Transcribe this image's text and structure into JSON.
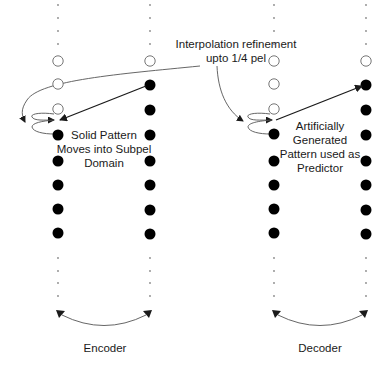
{
  "diagram": {
    "annotation": {
      "lines": [
        "Interpolation refinement",
        "upto 1/4 pel"
      ],
      "x": 236,
      "y": 48
    },
    "panels": [
      {
        "id": "encoder",
        "label": "Encoder",
        "label_pos": [
          105,
          352
        ],
        "caption": {
          "lines": [
            "Solid Pattern",
            "Moves into Subpel",
            "Domain"
          ],
          "x": 104,
          "y": 139
        },
        "columns": [
          {
            "x": 58,
            "small_dots_top": [
              5,
              18,
              31,
              44
            ],
            "hollow": [
              61,
              84,
              109
            ],
            "filled": [
              135,
              161,
              185,
              209,
              233
            ],
            "small_dots_bottom": [
              258,
              271,
              283,
              296
            ]
          },
          {
            "x": 150,
            "small_dots_top": [
              5,
              18,
              31,
              44
            ],
            "hollow": [
              61
            ],
            "filled": [
              85,
              110,
              135,
              161,
              185,
              210,
              234
            ],
            "small_dots_bottom": [
              258,
              271,
              283,
              296
            ]
          }
        ],
        "main_arrow": {
          "from": [
            146,
            86
          ],
          "to": [
            60,
            120
          ]
        }
      },
      {
        "id": "decoder",
        "label": "Decoder",
        "label_pos": [
          320,
          352
        ],
        "caption": {
          "lines": [
            "Artificially",
            "Generated",
            "Pattern used as",
            "Predictor"
          ],
          "x": 320,
          "y": 130
        },
        "columns": [
          {
            "x": 274,
            "small_dots_top": [
              5,
              18,
              31,
              44
            ],
            "hollow": [
              61,
              84,
              109
            ],
            "filled": [
              134,
              161,
              185,
              209,
              233
            ],
            "small_dots_bottom": [
              258,
              271,
              283,
              296
            ]
          },
          {
            "x": 366,
            "small_dots_top": [
              5,
              18,
              31,
              44
            ],
            "hollow": [
              61
            ],
            "filled": [
              85,
              110,
              135,
              161,
              185,
              210,
              234
            ],
            "small_dots_bottom": [
              258,
              271,
              283,
              296
            ]
          }
        ],
        "main_arrow": {
          "from": [
            276,
            120
          ],
          "to": [
            362,
            86
          ]
        }
      }
    ],
    "colors": {
      "stroke": "#1a1a1a",
      "curve": "#555555",
      "dot": "#000000",
      "small_dot": "#888888",
      "hollow_stroke": "#666666"
    }
  }
}
